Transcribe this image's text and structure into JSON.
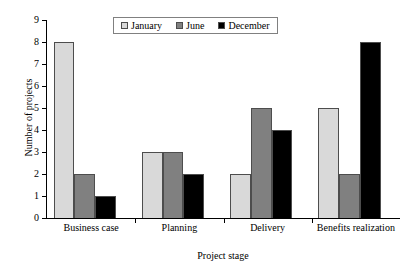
{
  "chart_data": {
    "type": "bar",
    "title": "",
    "xlabel": "Project stage",
    "ylabel": "Number of projects",
    "categories": [
      "Business case",
      "Planning",
      "Delivery",
      "Benefits realization"
    ],
    "series": [
      {
        "name": "January",
        "values": [
          8,
          3,
          2,
          5
        ],
        "color": "#d9d9d9"
      },
      {
        "name": "June",
        "values": [
          2,
          3,
          5,
          2
        ],
        "color": "#808080"
      },
      {
        "name": "December",
        "values": [
          1,
          2,
          4,
          8
        ],
        "color": "#000000"
      }
    ],
    "ylim": [
      0,
      9
    ],
    "yticks": [
      0,
      1,
      2,
      3,
      4,
      5,
      6,
      7,
      8,
      9
    ],
    "ytick_labels": [
      "0",
      "1",
      "2",
      "3",
      "4",
      "5",
      "6",
      "7",
      "8",
      "9"
    ],
    "grid": false,
    "legend_position": "top-center",
    "bar_border_color": "#4d4d4d",
    "axis_color": "#000000"
  }
}
